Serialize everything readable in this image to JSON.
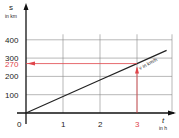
{
  "chart_data": {
    "type": "line",
    "title": "",
    "xlabel": "t",
    "xunit": "in h",
    "ylabel": "s",
    "yunit": "in km",
    "line_label": "v in km/h",
    "x_ticks": [
      "0",
      "1",
      "2",
      "3"
    ],
    "y_ticks": [
      "100",
      "200",
      "300",
      "400"
    ],
    "xlim": [
      0,
      3.9
    ],
    "ylim": [
      0,
      450
    ],
    "grid": true,
    "series": [
      {
        "name": "v in km/h",
        "x": [
          0,
          1,
          2,
          3,
          3.8
        ],
        "values": [
          0,
          90,
          180,
          270,
          342
        ]
      }
    ],
    "annotations": [
      {
        "type": "highlight-y",
        "value": 270,
        "label": "270",
        "color": "#e0454a"
      },
      {
        "type": "highlight-x",
        "value": 3,
        "label": "3",
        "color": "#e0454a"
      }
    ],
    "colors": {
      "line": "#222222",
      "grid": "#888888",
      "highlight": "#e0454a"
    }
  }
}
